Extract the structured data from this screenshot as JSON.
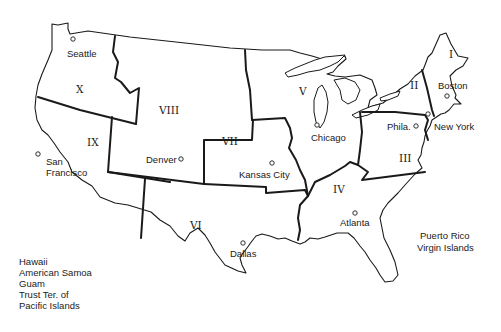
{
  "map": {
    "title": "Federal Regions of the United States",
    "colors": {
      "ink": "#1a1a1a",
      "background": "#ffffff"
    },
    "regions": [
      {
        "id": "I",
        "label": "I"
      },
      {
        "id": "II",
        "label": "II"
      },
      {
        "id": "III",
        "label": "III"
      },
      {
        "id": "IV",
        "label": "IV"
      },
      {
        "id": "V",
        "label": "V"
      },
      {
        "id": "VI",
        "label": "VI"
      },
      {
        "id": "VII",
        "label": "VII"
      },
      {
        "id": "VIII",
        "label": "VIII"
      },
      {
        "id": "IX",
        "label": "IX"
      },
      {
        "id": "X",
        "label": "X"
      }
    ],
    "cities": [
      {
        "name": "Seattle",
        "region": "X"
      },
      {
        "name": "San",
        "name2": "Francisco",
        "region": "IX"
      },
      {
        "name": "Denver",
        "region": "VIII"
      },
      {
        "name": "Kansas City",
        "region": "VII"
      },
      {
        "name": "Dallas",
        "region": "VI"
      },
      {
        "name": "Chicago",
        "region": "V"
      },
      {
        "name": "Atlanta",
        "region": "IV"
      },
      {
        "name": "Phila.",
        "region": "III"
      },
      {
        "name": "New York",
        "region": "II"
      },
      {
        "name": "Boston",
        "region": "I"
      }
    ],
    "territories": {
      "pacific": [
        "Hawaii",
        "American Samoa",
        "Guam",
        "Trust Ter. of",
        "Pacific Islands"
      ],
      "caribbean": [
        "Puerto Rico",
        "Virgin Islands"
      ]
    }
  }
}
